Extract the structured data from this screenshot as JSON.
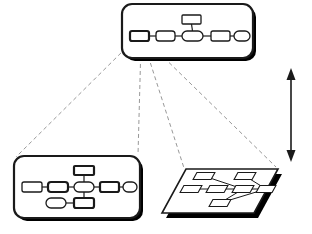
{
  "figure": {
    "type": "diagram",
    "subtype": "multi-level-model-refinement",
    "background_color": "#ffffff",
    "stroke_color": "#1a1a1a",
    "shadow_color": "#000000",
    "dashed_color": "#8c8c8c",
    "node_fill": "#ffffff",
    "width": 312,
    "height": 234
  },
  "panels": [
    {
      "id": "top-abstract-panel",
      "name": "top-level-diagram-panel",
      "shape": "rounded-rectangle",
      "x": 122,
      "y": 4,
      "w": 131,
      "h": 54,
      "corner_radius": 10,
      "stroke_width": 2.2,
      "has_drop_shadow": true,
      "shadow_offset_x": 3,
      "shadow_offset_y": 3,
      "nodes": [
        {
          "id": "t1",
          "name": "node-source",
          "x": 130,
          "y": 31,
          "w": 19,
          "h": 10,
          "rx": 2,
          "bold": true,
          "is_expansion_source": true
        },
        {
          "id": "t2",
          "name": "node-b",
          "x": 156,
          "y": 31,
          "w": 19,
          "h": 10,
          "rx": 3,
          "bold": false
        },
        {
          "id": "t3",
          "name": "node-center",
          "x": 182,
          "y": 31,
          "w": 21,
          "h": 10,
          "rx": 5,
          "bold": false
        },
        {
          "id": "t4",
          "name": "node-d",
          "x": 211,
          "y": 31,
          "w": 19,
          "h": 10,
          "rx": 2,
          "bold": false
        },
        {
          "id": "t5",
          "name": "node-e",
          "x": 234,
          "y": 31,
          "w": 16,
          "h": 10,
          "rx": 5,
          "bold": false
        },
        {
          "id": "t6",
          "name": "node-top-branch",
          "x": 182,
          "y": 15,
          "w": 19,
          "h": 9,
          "rx": 1,
          "bold": false
        }
      ],
      "edges": [
        {
          "from": "t1",
          "to": "t2"
        },
        {
          "from": "t2",
          "to": "t3"
        },
        {
          "from": "t3",
          "to": "t4"
        },
        {
          "from": "t4",
          "to": "t5"
        },
        {
          "from": "t6",
          "to": "t3",
          "orientation": "vertical"
        }
      ]
    },
    {
      "id": "bottom-left-detail-panel",
      "name": "refined-diagram-panel",
      "shape": "rounded-rectangle",
      "x": 14,
      "y": 156,
      "w": 126,
      "h": 62,
      "corner_radius": 10,
      "stroke_width": 2.2,
      "has_drop_shadow": true,
      "shadow_offset_x": 3,
      "shadow_offset_y": 3,
      "nodes": [
        {
          "id": "l1",
          "name": "node-a",
          "x": 22,
          "y": 182,
          "w": 20,
          "h": 10,
          "rx": 2,
          "bold": false
        },
        {
          "id": "l2",
          "name": "node-b",
          "x": 48,
          "y": 182,
          "w": 20,
          "h": 10,
          "rx": 3,
          "bold": true
        },
        {
          "id": "l3",
          "name": "node-center",
          "x": 74,
          "y": 182,
          "w": 20,
          "h": 10,
          "rx": 5,
          "bold": false
        },
        {
          "id": "l4",
          "name": "node-d",
          "x": 100,
          "y": 182,
          "w": 19,
          "h": 10,
          "rx": 2,
          "bold": true
        },
        {
          "id": "l5",
          "name": "node-e",
          "x": 123,
          "y": 182,
          "w": 14,
          "h": 10,
          "rx": 5,
          "bold": false
        },
        {
          "id": "l6",
          "name": "node-upper-branch",
          "x": 74,
          "y": 166,
          "w": 20,
          "h": 9,
          "rx": 1,
          "bold": true
        },
        {
          "id": "l7",
          "name": "node-lower-branch",
          "x": 74,
          "y": 198,
          "w": 20,
          "h": 10,
          "rx": 2,
          "bold": true
        },
        {
          "id": "l8",
          "name": "node-lower-left",
          "x": 46,
          "y": 198,
          "w": 20,
          "h": 10,
          "rx": 5,
          "bold": false
        }
      ],
      "edges": [
        {
          "from": "l1",
          "to": "l2"
        },
        {
          "from": "l2",
          "to": "l3"
        },
        {
          "from": "l3",
          "to": "l4"
        },
        {
          "from": "l4",
          "to": "l5"
        },
        {
          "from": "l6",
          "to": "l3",
          "orientation": "vertical"
        },
        {
          "from": "l3",
          "to": "l7",
          "orientation": "vertical"
        },
        {
          "from": "l8",
          "to": "l7"
        }
      ]
    },
    {
      "id": "bottom-right-plane-panel",
      "name": "perspective-plane-panel",
      "shape": "parallelogram",
      "stroke_width": 1.6,
      "has_drop_shadow": true,
      "shadow_offset_x": 4,
      "shadow_offset_y": 5,
      "corners": [
        {
          "x": 186,
          "y": 169
        },
        {
          "x": 278,
          "y": 169
        },
        {
          "x": 254,
          "y": 213
        },
        {
          "x": 162,
          "y": 213
        }
      ],
      "nodes": [
        {
          "id": "p1",
          "name": "node-top-left",
          "cx": 204,
          "cy": 176,
          "w": 18,
          "h": 7
        },
        {
          "id": "p2",
          "name": "node-top-right",
          "cx": 245,
          "cy": 176,
          "w": 18,
          "h": 7
        },
        {
          "id": "p3",
          "name": "node-mid-left",
          "cx": 191,
          "cy": 189,
          "w": 18,
          "h": 7
        },
        {
          "id": "p4",
          "name": "node-mid-center",
          "cx": 217,
          "cy": 189,
          "w": 18,
          "h": 7
        },
        {
          "id": "p5",
          "name": "node-mid-right",
          "cx": 243,
          "cy": 189,
          "w": 18,
          "h": 7
        },
        {
          "id": "p6",
          "name": "node-far-right",
          "cx": 266,
          "cy": 189,
          "w": 16,
          "h": 7
        },
        {
          "id": "p7",
          "name": "node-bottom",
          "cx": 220,
          "cy": 203,
          "w": 18,
          "h": 7
        }
      ],
      "edges": [
        {
          "from": "p1",
          "to": "p5"
        },
        {
          "from": "p3",
          "to": "p4"
        },
        {
          "from": "p4",
          "to": "p5"
        },
        {
          "from": "p5",
          "to": "p6"
        },
        {
          "from": "p2",
          "to": "p6"
        },
        {
          "from": "p5",
          "to": "p7"
        },
        {
          "from": "p7",
          "to": "p6"
        }
      ]
    }
  ],
  "projection_lines": {
    "name": "expansion-dashed-lines",
    "style": "dashed",
    "dash_pattern": "4 3",
    "stroke_width": 0.9,
    "color": "#8c8c8c",
    "origin": {
      "x": 133,
      "y": 43
    },
    "origin_secondary": {
      "x": 145,
      "y": 43
    },
    "lines": [
      {
        "from_x": 131,
        "from_y": 43,
        "to_x": 16,
        "to_y": 157,
        "target": "bottom-left-detail-panel-topleft"
      },
      {
        "from_x": 141,
        "from_y": 43,
        "to_x": 138,
        "to_y": 155,
        "target": "bottom-left-detail-panel-topright"
      },
      {
        "from_x": 144,
        "from_y": 43,
        "to_x": 184,
        "to_y": 168,
        "target": "perspective-plane-topleft"
      },
      {
        "from_x": 149,
        "from_y": 43,
        "to_x": 276,
        "to_y": 167,
        "target": "perspective-plane-topright"
      }
    ]
  },
  "axis_arrow": {
    "name": "abstraction-level-arrow",
    "orientation": "vertical",
    "double_headed": true,
    "x": 291,
    "y_top": 68,
    "y_bottom": 162,
    "stroke_width": 1.6,
    "head_width": 9,
    "head_length": 12,
    "color": "#1a1a1a"
  }
}
